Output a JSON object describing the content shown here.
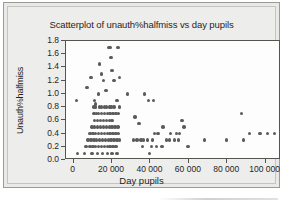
{
  "chart_data": {
    "type": "scatter",
    "title": "Scatterplot of unauth%halfmiss vs day pupils",
    "xlabel": "Day pupils",
    "ylabel": "Unauth%halfmiss",
    "xlim": [
      -4000,
      108000
    ],
    "ylim": [
      0.0,
      1.8
    ],
    "grid": false,
    "legend": null,
    "xticks": [
      {
        "value": 0,
        "label": "0"
      },
      {
        "value": 20000,
        "label": "20 000"
      },
      {
        "value": 40000,
        "label": "40 000"
      },
      {
        "value": 60000,
        "label": "60 000"
      },
      {
        "value": 80000,
        "label": "80 000"
      },
      {
        "value": 100000,
        "label": "100 000"
      }
    ],
    "yticks": [
      {
        "value": 0.0,
        "label": "0.0"
      },
      {
        "value": 0.2,
        "label": "0.2"
      },
      {
        "value": 0.4,
        "label": "0.4"
      },
      {
        "value": 0.6,
        "label": "0.6"
      },
      {
        "value": 0.8,
        "label": "0.8"
      },
      {
        "value": 1.0,
        "label": "1.0"
      },
      {
        "value": 1.2,
        "label": "1.2"
      },
      {
        "value": 1.4,
        "label": "1.4"
      },
      {
        "value": 1.6,
        "label": "1.6"
      },
      {
        "value": 1.8,
        "label": "1.8"
      }
    ],
    "marker": {
      "shape": "circle",
      "color": "#5b5b5b",
      "size": 3.4
    },
    "points": [
      [
        1000,
        0.0
      ],
      [
        2000,
        0.1
      ],
      [
        1500,
        0.9
      ],
      [
        7000,
        1.1
      ],
      [
        9000,
        1.25
      ],
      [
        11000,
        0.9
      ],
      [
        11500,
        0.85
      ],
      [
        13000,
        1.0
      ],
      [
        13500,
        1.45
      ],
      [
        14500,
        1.3
      ],
      [
        15500,
        1.2
      ],
      [
        16500,
        1.05
      ],
      [
        17000,
        1.05
      ],
      [
        18000,
        1.7
      ],
      [
        19000,
        1.7
      ],
      [
        19500,
        1.55
      ],
      [
        20000,
        1.35
      ],
      [
        21000,
        1.2
      ],
      [
        23000,
        1.7
      ],
      [
        24000,
        1.25
      ],
      [
        28000,
        1.0
      ],
      [
        37000,
        1.0
      ],
      [
        10500,
        0.8
      ],
      [
        11500,
        0.8
      ],
      [
        13500,
        0.8
      ],
      [
        14500,
        0.8
      ],
      [
        16000,
        0.8
      ],
      [
        17000,
        0.8
      ],
      [
        18500,
        0.8
      ],
      [
        19500,
        0.8
      ],
      [
        21000,
        0.8
      ],
      [
        22500,
        0.9
      ],
      [
        24000,
        0.8
      ],
      [
        39000,
        0.9
      ],
      [
        41500,
        0.9
      ],
      [
        10500,
        0.7
      ],
      [
        12000,
        0.7
      ],
      [
        13000,
        0.7
      ],
      [
        14500,
        0.7
      ],
      [
        16000,
        0.7
      ],
      [
        17500,
        0.7
      ],
      [
        19000,
        0.7
      ],
      [
        20500,
        0.7
      ],
      [
        22000,
        0.7
      ],
      [
        23500,
        0.7
      ],
      [
        11000,
        0.6
      ],
      [
        12500,
        0.6
      ],
      [
        14000,
        0.6
      ],
      [
        15500,
        0.6
      ],
      [
        17000,
        0.6
      ],
      [
        18500,
        0.6
      ],
      [
        20000,
        0.6
      ],
      [
        32000,
        0.65
      ],
      [
        56500,
        0.6
      ],
      [
        9500,
        0.5
      ],
      [
        11000,
        0.5
      ],
      [
        12500,
        0.5
      ],
      [
        14000,
        0.5
      ],
      [
        15500,
        0.5
      ],
      [
        17000,
        0.5
      ],
      [
        18500,
        0.5
      ],
      [
        20000,
        0.5
      ],
      [
        21500,
        0.5
      ],
      [
        23000,
        0.5
      ],
      [
        34000,
        0.55
      ],
      [
        46500,
        0.5
      ],
      [
        57500,
        0.5
      ],
      [
        8500,
        0.4
      ],
      [
        10000,
        0.4
      ],
      [
        11500,
        0.4
      ],
      [
        13000,
        0.4
      ],
      [
        14500,
        0.4
      ],
      [
        16000,
        0.4
      ],
      [
        17500,
        0.4
      ],
      [
        19000,
        0.4
      ],
      [
        20500,
        0.4
      ],
      [
        22000,
        0.4
      ],
      [
        23500,
        0.4
      ],
      [
        42000,
        0.4
      ],
      [
        44000,
        0.4
      ],
      [
        50500,
        0.4
      ],
      [
        53500,
        0.4
      ],
      [
        55000,
        0.4
      ],
      [
        91500,
        0.4
      ],
      [
        97000,
        0.4
      ],
      [
        101000,
        0.4
      ],
      [
        104500,
        0.4
      ],
      [
        7500,
        0.3
      ],
      [
        9000,
        0.3
      ],
      [
        10500,
        0.3
      ],
      [
        12000,
        0.3
      ],
      [
        13500,
        0.3
      ],
      [
        15000,
        0.3
      ],
      [
        16500,
        0.3
      ],
      [
        18000,
        0.3
      ],
      [
        19500,
        0.3
      ],
      [
        21000,
        0.3
      ],
      [
        22500,
        0.3
      ],
      [
        24000,
        0.3
      ],
      [
        31000,
        0.3
      ],
      [
        33000,
        0.3
      ],
      [
        35000,
        0.3
      ],
      [
        36500,
        0.3
      ],
      [
        38500,
        0.3
      ],
      [
        41000,
        0.3
      ],
      [
        48500,
        0.3
      ],
      [
        50000,
        0.3
      ],
      [
        52500,
        0.3
      ],
      [
        54500,
        0.3
      ],
      [
        68000,
        0.3
      ],
      [
        79500,
        0.3
      ],
      [
        88500,
        0.3
      ],
      [
        6500,
        0.2
      ],
      [
        8500,
        0.2
      ],
      [
        10000,
        0.2
      ],
      [
        11500,
        0.2
      ],
      [
        13000,
        0.2
      ],
      [
        14500,
        0.2
      ],
      [
        16000,
        0.2
      ],
      [
        17500,
        0.2
      ],
      [
        19000,
        0.2
      ],
      [
        20500,
        0.2
      ],
      [
        22000,
        0.2
      ],
      [
        36000,
        0.2
      ],
      [
        40500,
        0.2
      ],
      [
        43000,
        0.2
      ],
      [
        46000,
        0.2
      ],
      [
        59500,
        0.2
      ],
      [
        5500,
        0.1
      ],
      [
        9500,
        0.1
      ],
      [
        12500,
        0.1
      ],
      [
        15000,
        0.1
      ],
      [
        17500,
        0.1
      ],
      [
        20000,
        0.1
      ],
      [
        22500,
        0.1
      ],
      [
        39500,
        0.1
      ],
      [
        87500,
        0.7
      ]
    ]
  }
}
